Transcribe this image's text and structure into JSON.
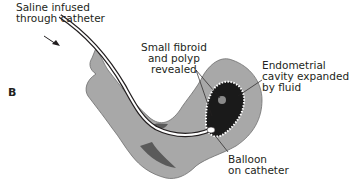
{
  "figure": {
    "panel_label": "B",
    "labels": {
      "saline": [
        "Saline infused",
        "through catheter"
      ],
      "fibroid": [
        "Small fibroid",
        "and polyp",
        "revealed"
      ],
      "cavity": [
        "Endometrial",
        "cavity expanded",
        "by fluid"
      ],
      "balloon": [
        "Balloon",
        "on catheter"
      ]
    },
    "colors": {
      "uterus_fill": "#a8a8a8",
      "uterus_outline": "#6d6d6d",
      "dark_tissue": "#5a5a5a",
      "cavity": "#1a1a1a",
      "catheter": "#ffffff",
      "text": "#231f20"
    }
  }
}
